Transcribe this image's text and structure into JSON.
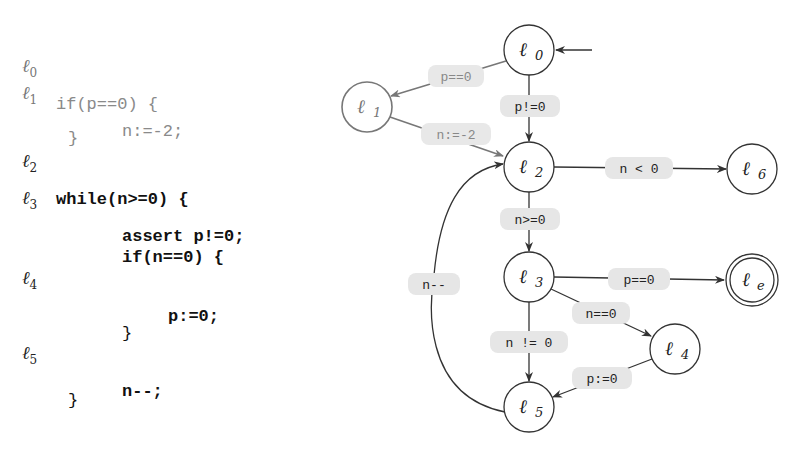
{
  "code": {
    "lines": [
      {
        "label": "ℓ",
        "sub": "0",
        "text": "if(p==0) {",
        "dim": true
      },
      {
        "label": "ℓ",
        "sub": "1",
        "text": "n:=-2;",
        "dim": true
      },
      {
        "label": "",
        "sub": "",
        "text": "}",
        "dim": true
      },
      {
        "label": "ℓ",
        "sub": "2",
        "text": "while(n>=0) {",
        "dim": false
      },
      {
        "label": "ℓ",
        "sub": "3",
        "text": "assert p!=0;",
        "dim": false
      },
      {
        "label": "",
        "sub": "",
        "text": "if(n==0) {",
        "dim": false
      },
      {
        "label": "ℓ",
        "sub": "4",
        "text": "p:=0;",
        "dim": false
      },
      {
        "label": "",
        "sub": "",
        "text": "}",
        "dim": false
      },
      {
        "label": "ℓ",
        "sub": "5",
        "text": "n--;",
        "dim": false
      },
      {
        "label": "",
        "sub": "",
        "text": "}",
        "dim": false
      }
    ]
  },
  "graph": {
    "nodes": [
      {
        "id": "l0",
        "label": "ℓ",
        "sub": "0",
        "x": 529,
        "y": 50,
        "accepting": false,
        "dim": false
      },
      {
        "id": "l1",
        "label": "ℓ",
        "sub": "1",
        "x": 367,
        "y": 107,
        "accepting": false,
        "dim": true
      },
      {
        "id": "l2",
        "label": "ℓ",
        "sub": "2",
        "x": 529,
        "y": 167,
        "accepting": false,
        "dim": false
      },
      {
        "id": "l6",
        "label": "ℓ",
        "sub": "6",
        "x": 752,
        "y": 169,
        "accepting": false,
        "dim": false
      },
      {
        "id": "l3",
        "label": "ℓ",
        "sub": "3",
        "x": 529,
        "y": 277,
        "accepting": false,
        "dim": false
      },
      {
        "id": "le",
        "label": "ℓ",
        "sub": "e",
        "x": 752,
        "y": 280,
        "accepting": true,
        "dim": false
      },
      {
        "id": "l4",
        "label": "ℓ",
        "sub": "4",
        "x": 675,
        "y": 349,
        "accepting": false,
        "dim": false
      },
      {
        "id": "l5",
        "label": "ℓ",
        "sub": "5",
        "x": 529,
        "y": 407,
        "accepting": false,
        "dim": false
      }
    ],
    "edges": [
      {
        "from": "start",
        "to": "l0",
        "label": ""
      },
      {
        "from": "l0",
        "to": "l1",
        "label": "p==0",
        "dim": true
      },
      {
        "from": "l0",
        "to": "l2",
        "label": "p!=0"
      },
      {
        "from": "l1",
        "to": "l2",
        "label": "n:=-2",
        "dim": true
      },
      {
        "from": "l2",
        "to": "l6",
        "label": "n < 0"
      },
      {
        "from": "l2",
        "to": "l3",
        "label": "n>=0"
      },
      {
        "from": "l3",
        "to": "le",
        "label": "p==0"
      },
      {
        "from": "l3",
        "to": "l4",
        "label": "n==0"
      },
      {
        "from": "l3",
        "to": "l5",
        "label": "n != 0"
      },
      {
        "from": "l4",
        "to": "l5",
        "label": "p:=0"
      },
      {
        "from": "l5",
        "to": "l2",
        "label": "n--"
      }
    ]
  },
  "colors": {
    "edge": "#333333",
    "dim_edge": "#777777",
    "label_bg": "#e6e6e6",
    "dim_text": "#8a8a8a"
  }
}
